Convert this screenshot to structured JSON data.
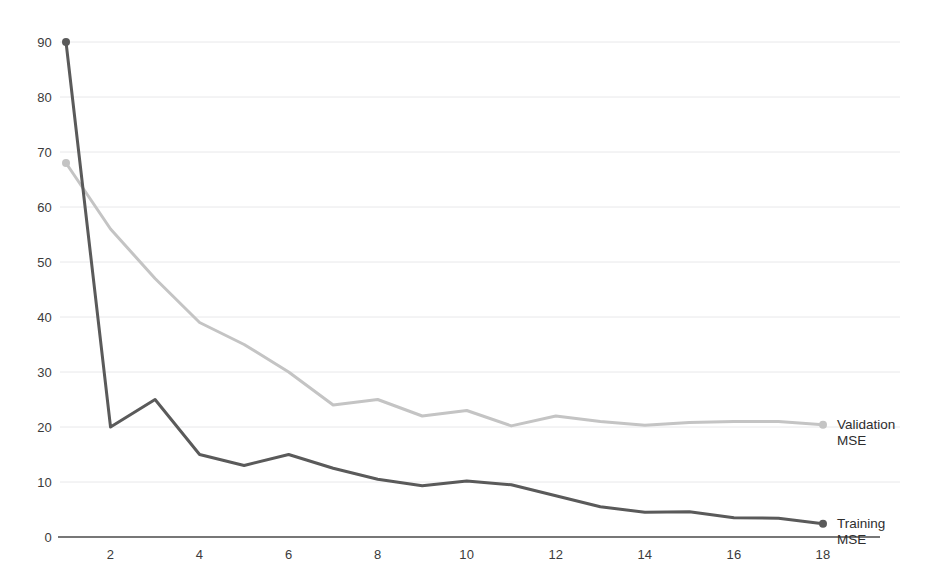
{
  "chart_data": {
    "type": "line",
    "title": "",
    "subtitle": "",
    "xlabel": "",
    "ylabel": "",
    "x": [
      1,
      2,
      3,
      4,
      5,
      6,
      7,
      8,
      9,
      10,
      11,
      12,
      13,
      14,
      15,
      16,
      17,
      18
    ],
    "xlim": [
      1,
      18
    ],
    "ylim": [
      0,
      92
    ],
    "grid": true,
    "grid_axis": "y",
    "legend_position": "right-inline-end-of-line",
    "x_tick_labels": [
      "2",
      "4",
      "6",
      "8",
      "10",
      "12",
      "14",
      "16",
      "18"
    ],
    "x_tick_values": [
      2,
      4,
      6,
      8,
      10,
      12,
      14,
      16,
      18
    ],
    "y_tick_labels": [
      "0",
      "10",
      "20",
      "30",
      "40",
      "50",
      "60",
      "70",
      "80",
      "90"
    ],
    "y_tick_values": [
      0,
      10,
      20,
      30,
      40,
      50,
      60,
      70,
      80,
      90
    ],
    "series": [
      {
        "name": "Training MSE",
        "label_lines": [
          "Training",
          "MSE"
        ],
        "color": "#5a5a5a",
        "values": [
          90,
          20,
          25,
          15,
          13,
          15,
          12.5,
          10.5,
          9.3,
          10.2,
          9.5,
          7.5,
          5.5,
          4.5,
          4.6,
          3.5,
          3.4,
          2.4
        ]
      },
      {
        "name": "Validation MSE",
        "label_lines": [
          "Validation",
          "MSE"
        ],
        "color": "#c4c4c4",
        "values": [
          68,
          56,
          47,
          39,
          35,
          30,
          24,
          25,
          22,
          23,
          20.2,
          22,
          21,
          20.3,
          20.8,
          21,
          21,
          20.4
        ]
      }
    ],
    "markers": {
      "first_point_series": [
        "Training MSE",
        "Validation MSE"
      ],
      "last_point_series": [
        "Training MSE",
        "Validation MSE"
      ]
    },
    "colors": {
      "axis": "#4a4a4a",
      "grid": "#e8e8ea",
      "tick_text": "#3b3b3b",
      "background": "#ffffff"
    }
  }
}
